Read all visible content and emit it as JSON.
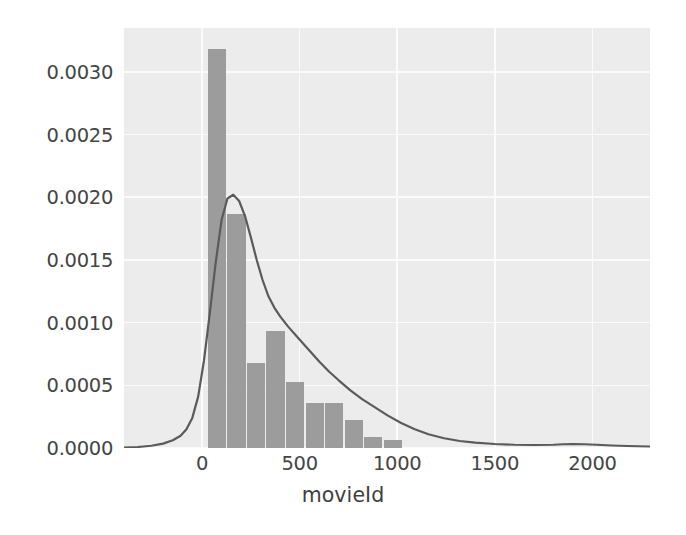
{
  "chart_data": {
    "type": "histogram",
    "title": "",
    "xlabel": "movieId",
    "ylabel": "",
    "xlim": [
      -400,
      2295
    ],
    "ylim": [
      0.0,
      0.00335
    ],
    "xticks": [
      0,
      500,
      1000,
      1500,
      2000
    ],
    "xticklabels": [
      "0",
      "500",
      "1000",
      "1500",
      "2000"
    ],
    "yticks": [
      0.0,
      0.0005,
      0.001,
      0.0015,
      0.002,
      0.0025,
      0.003
    ],
    "yticklabels": [
      "0.0000",
      "0.0005",
      "0.0010",
      "0.0015",
      "0.0020",
      "0.0025",
      "0.0030"
    ],
    "grid": true,
    "legend": null,
    "bar_color": "#9c9c9c",
    "line_color": "#5a5a5a",
    "bg_color": "#ececed",
    "bins": [
      {
        "x0": 30,
        "x1": 130,
        "density": 0.00318
      },
      {
        "x0": 130,
        "x1": 230,
        "density": 0.00187
      },
      {
        "x0": 230,
        "x1": 330,
        "density": 0.00068
      },
      {
        "x0": 330,
        "x1": 430,
        "density": 0.00093
      },
      {
        "x0": 430,
        "x1": 530,
        "density": 0.00053
      },
      {
        "x0": 530,
        "x1": 630,
        "density": 0.00036
      },
      {
        "x0": 630,
        "x1": 730,
        "density": 0.00036
      },
      {
        "x0": 730,
        "x1": 830,
        "density": 0.00022
      },
      {
        "x0": 830,
        "x1": 930,
        "density": 9e-05
      },
      {
        "x0": 930,
        "x1": 1030,
        "density": 6e-05
      }
    ],
    "kde": {
      "name": "density",
      "x": [
        -400,
        -330,
        -260,
        -200,
        -150,
        -110,
        -80,
        -50,
        -20,
        10,
        40,
        70,
        100,
        130,
        160,
        190,
        220,
        250,
        280,
        310,
        340,
        370,
        400,
        440,
        480,
        520,
        560,
        600,
        650,
        700,
        760,
        820,
        880,
        950,
        1020,
        1090,
        1160,
        1240,
        1320,
        1400,
        1500,
        1600,
        1700,
        1800,
        1850,
        1900,
        1960,
        2020,
        2100,
        2180,
        2295
      ],
      "y": [
        4e-06,
        8e-06,
        1.8e-05,
        3.5e-05,
        6.2e-05,
        9.8e-05,
        0.00015,
        0.00024,
        0.00041,
        0.0007,
        0.00108,
        0.00148,
        0.00182,
        0.00199,
        0.00202,
        0.00197,
        0.00185,
        0.00168,
        0.0015,
        0.00134,
        0.00121,
        0.00112,
        0.00105,
        0.00097,
        0.0009,
        0.00083,
        0.00076,
        0.00069,
        0.00061,
        0.00054,
        0.00046,
        0.00039,
        0.00033,
        0.00026,
        0.0002,
        0.00015,
        0.00011,
        7.8e-05,
        5.6e-05,
        4.3e-05,
        3.2e-05,
        2.6e-05,
        2.4e-05,
        2.6e-05,
        3e-05,
        3.2e-05,
        3e-05,
        2.6e-05,
        2e-05,
        1.6e-05,
        1.2e-05
      ]
    }
  }
}
